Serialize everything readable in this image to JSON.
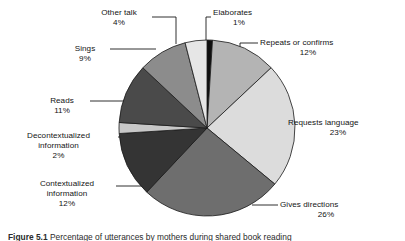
{
  "figure": {
    "caption_label": "Figure",
    "caption_number": "5.1",
    "caption_text": "Percentage of utterances by mothers during shared book reading"
  },
  "chart_data": {
    "type": "pie",
    "title": "",
    "xlabel": "",
    "ylabel": "",
    "units": "percent",
    "start_angle_deg": 0,
    "direction": "clockwise",
    "legend": "none",
    "labels_placement": "outside-with-leader-lines",
    "categories": [
      "Elaborates",
      "Repeats or confirms",
      "Requests language",
      "Gives directions",
      "Contextualized information",
      "Decontextualized information",
      "Reads",
      "Sings",
      "Other talk"
    ],
    "values": [
      1,
      12,
      23,
      26,
      12,
      2,
      11,
      9,
      4
    ],
    "value_labels": [
      "1%",
      "12%",
      "23%",
      "26%",
      "12%",
      "2%",
      "11%",
      "9%",
      "4%"
    ],
    "colors": [
      "#101010",
      "#b4b4b4",
      "#dcdcdc",
      "#6e6e6e",
      "#343434",
      "#c8c8c8",
      "#4a4a4a",
      "#8c8c8c",
      "#e6e6e6"
    ],
    "slice_border_color": "#1a1a1a",
    "slices": [
      {
        "name": "Elaborates",
        "value": 1,
        "value_label": "1%",
        "color": "#101010"
      },
      {
        "name": "Repeats or confirms",
        "value": 12,
        "value_label": "12%",
        "color": "#b4b4b4"
      },
      {
        "name": "Requests language",
        "value": 23,
        "value_label": "23%",
        "color": "#dcdcdc"
      },
      {
        "name": "Gives directions",
        "value": 26,
        "value_label": "26%",
        "color": "#6e6e6e"
      },
      {
        "name": "Contextualized information",
        "value": 12,
        "value_label": "12%",
        "color": "#343434"
      },
      {
        "name": "Decontextualized information",
        "value": 2,
        "value_label": "2%",
        "color": "#c8c8c8"
      },
      {
        "name": "Reads",
        "value": 11,
        "value_label": "11%",
        "color": "#4a4a4a"
      },
      {
        "name": "Sings",
        "value": 9,
        "value_label": "9%",
        "color": "#8c8c8c"
      },
      {
        "name": "Other talk",
        "value": 4,
        "value_label": "4%",
        "color": "#e6e6e6"
      }
    ],
    "total": 100
  },
  "labels": {
    "elaborates": {
      "name": "Elaborates",
      "pct": "1%"
    },
    "repeats": {
      "name": "Repeats or confirms",
      "pct": "12%"
    },
    "requests": {
      "name": "Requests language",
      "pct": "23%"
    },
    "gives": {
      "name": "Gives directions",
      "pct": "26%"
    },
    "contextualized": {
      "name_line1": "Contextualized",
      "name_line2": "information",
      "pct": "12%"
    },
    "decontextualized": {
      "name_line1": "Decontextualized",
      "name_line2": "information",
      "pct": "2%"
    },
    "reads": {
      "name": "Reads",
      "pct": "11%"
    },
    "sings": {
      "name": "Sings",
      "pct": "9%"
    },
    "other_talk": {
      "name": "Other talk",
      "pct": "4%"
    }
  }
}
